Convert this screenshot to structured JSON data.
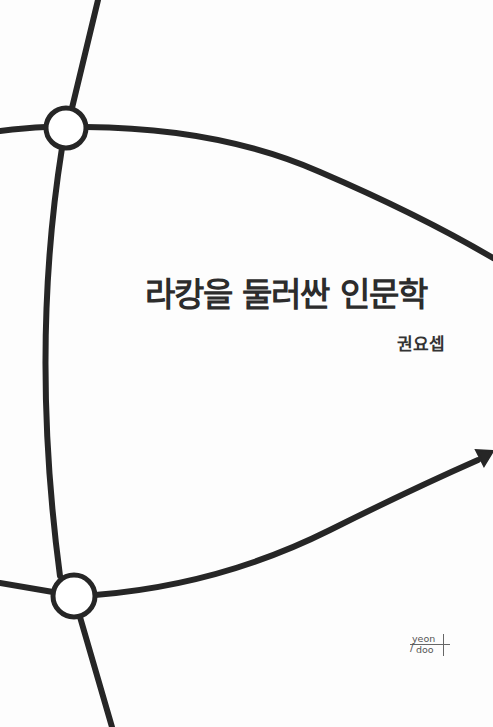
{
  "cover": {
    "title": "라캉을 둘러싼 인문학",
    "author": "권요셉",
    "publisher_logo": {
      "line1": "yeon",
      "line2": "doo",
      "slash": "/"
    },
    "colors": {
      "background": "#fdfdfd",
      "line": "#262626",
      "text": "#2c2c2c"
    },
    "graphic": {
      "nodes": [
        {
          "name": "top-node",
          "cx": 66,
          "cy": 128,
          "r": 20
        },
        {
          "name": "bottom-node",
          "cx": 74,
          "cy": 596,
          "r": 21
        }
      ],
      "arrowhead": "right-edge-arrow"
    }
  }
}
